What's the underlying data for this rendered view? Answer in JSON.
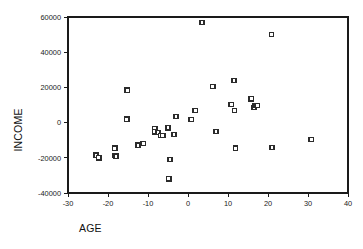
{
  "chart_data": {
    "type": "scatter",
    "title": "",
    "xlabel": "AGE",
    "ylabel": "INCOME",
    "xlim": [
      -30,
      40
    ],
    "ylim": [
      -40000,
      60000
    ],
    "xticks": [
      -30,
      -20,
      -10,
      0,
      10,
      20,
      30,
      40
    ],
    "yticks": [
      -40000,
      -20000,
      0,
      20000,
      40000,
      60000
    ],
    "xtick_labels": [
      "-30",
      "-20",
      "-10",
      "0",
      "10",
      "20",
      "30",
      "40"
    ],
    "ytick_labels": [
      "-40000",
      "-20000",
      "0",
      "20000",
      "40000",
      "60000"
    ],
    "grid": false,
    "legend": null,
    "marker": "open-square",
    "series": [
      {
        "name": "INCOME vs AGE",
        "points": [
          [
            -23.0,
            -18500
          ],
          [
            -22.3,
            -20000
          ],
          [
            -18.3,
            -14500
          ],
          [
            -18.3,
            -18800
          ],
          [
            -18.0,
            -19000
          ],
          [
            -15.2,
            18500
          ],
          [
            -15.3,
            2000
          ],
          [
            -12.5,
            -12800
          ],
          [
            -11.2,
            -11800
          ],
          [
            -8.3,
            -3500
          ],
          [
            -8.3,
            -5300
          ],
          [
            -7.5,
            -5500
          ],
          [
            -6.8,
            -7200
          ],
          [
            -6.3,
            -7300
          ],
          [
            -5.0,
            -3000
          ],
          [
            -4.8,
            -32000
          ],
          [
            -4.5,
            -21000
          ],
          [
            -3.5,
            -6800
          ],
          [
            -3.0,
            3500
          ],
          [
            0.8,
            1700
          ],
          [
            1.8,
            6800
          ],
          [
            3.5,
            57000
          ],
          [
            6.2,
            20500
          ],
          [
            7.0,
            -5000
          ],
          [
            10.8,
            10200
          ],
          [
            11.5,
            24000
          ],
          [
            11.6,
            6800
          ],
          [
            11.9,
            -14500
          ],
          [
            15.8,
            13500
          ],
          [
            16.5,
            8500
          ],
          [
            16.8,
            9800
          ],
          [
            17.3,
            9800
          ],
          [
            20.9,
            50000
          ],
          [
            21.0,
            -14000
          ],
          [
            30.8,
            -9500
          ]
        ]
      }
    ]
  },
  "axis": {
    "x_title": "AGE",
    "y_title": "INCOME"
  },
  "colors": {
    "marker_stroke": "#2b2b2b",
    "marker_fill": "#ffffff",
    "axis": "#1a1a1a",
    "background": "#ffffff"
  }
}
